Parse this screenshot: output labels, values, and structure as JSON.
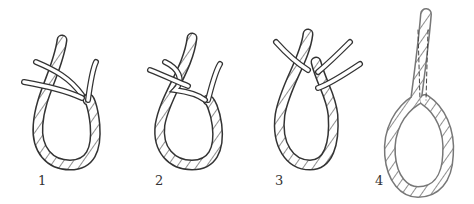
{
  "figure": {
    "steps": [
      {
        "label": "1"
      },
      {
        "label": "2"
      },
      {
        "label": "3"
      },
      {
        "label": "4"
      }
    ]
  }
}
